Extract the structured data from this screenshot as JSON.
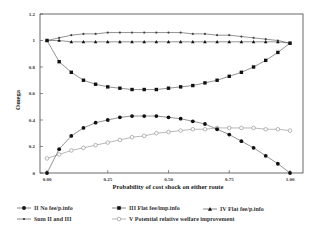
{
  "chart_data": {
    "type": "line",
    "title": "",
    "xlabel": "Probability of cost shock on either route",
    "ylabel": "Omega",
    "xlim": [
      0,
      1
    ],
    "ylim": [
      0,
      1.2
    ],
    "xticks": [
      "0.00",
      "0.25",
      "0.50",
      "0.75",
      "1.00"
    ],
    "yticks": [
      "0",
      "0.2",
      "0.4",
      "0.6",
      "0.8",
      "1",
      "1.2"
    ],
    "grid": false,
    "legend_position": "bottom",
    "x": [
      0,
      0.05,
      0.1,
      0.15,
      0.2,
      0.25,
      0.3,
      0.35,
      0.4,
      0.45,
      0.5,
      0.55,
      0.6,
      0.65,
      0.7,
      0.75,
      0.8,
      0.85,
      0.9,
      0.95,
      1.0
    ],
    "series": [
      {
        "name": "II No fee/p.info",
        "marker": "filled-circle",
        "values": [
          0,
          0.18,
          0.28,
          0.34,
          0.38,
          0.4,
          0.42,
          0.43,
          0.43,
          0.43,
          0.42,
          0.41,
          0.39,
          0.37,
          0.33,
          0.29,
          0.24,
          0.19,
          0.13,
          0.07,
          0
        ]
      },
      {
        "name": "III Flat fee/imp.info",
        "marker": "filled-square",
        "values": [
          1,
          0.84,
          0.76,
          0.7,
          0.67,
          0.65,
          0.64,
          0.63,
          0.63,
          0.63,
          0.64,
          0.65,
          0.66,
          0.68,
          0.7,
          0.73,
          0.76,
          0.8,
          0.85,
          0.91,
          0.98
        ]
      },
      {
        "name": "IV Flat fee/p.info",
        "marker": "triangle",
        "values": [
          1,
          1,
          0.99,
          0.99,
          0.99,
          0.99,
          0.99,
          0.99,
          0.99,
          0.99,
          0.99,
          0.99,
          0.99,
          0.99,
          0.99,
          0.99,
          0.99,
          0.99,
          0.99,
          0.99,
          0.98
        ]
      },
      {
        "name": "Sum II and III",
        "marker": "small-dot",
        "values": [
          1,
          1.02,
          1.04,
          1.05,
          1.05,
          1.06,
          1.06,
          1.06,
          1.06,
          1.06,
          1.06,
          1.06,
          1.05,
          1.05,
          1.04,
          1.04,
          1.03,
          1.02,
          1.01,
          1.0,
          0.98
        ]
      },
      {
        "name": "V Potential relative welfare improvement",
        "marker": "open-circle",
        "values": [
          0.11,
          0.14,
          0.17,
          0.19,
          0.21,
          0.23,
          0.25,
          0.27,
          0.28,
          0.3,
          0.31,
          0.32,
          0.33,
          0.33,
          0.34,
          0.34,
          0.34,
          0.34,
          0.33,
          0.33,
          0.32
        ]
      }
    ]
  },
  "legend": [
    {
      "label": "II No fee/p.info",
      "marker": "filled-circle"
    },
    {
      "label": "III Flat fee/imp.info",
      "marker": "filled-square"
    },
    {
      "label": "IV Flat fee/p.info",
      "marker": "triangle"
    },
    {
      "label": "Sum II and III",
      "marker": "small-dot"
    },
    {
      "label": "V Potential relative welfare improvement",
      "marker": "open-circle"
    }
  ]
}
